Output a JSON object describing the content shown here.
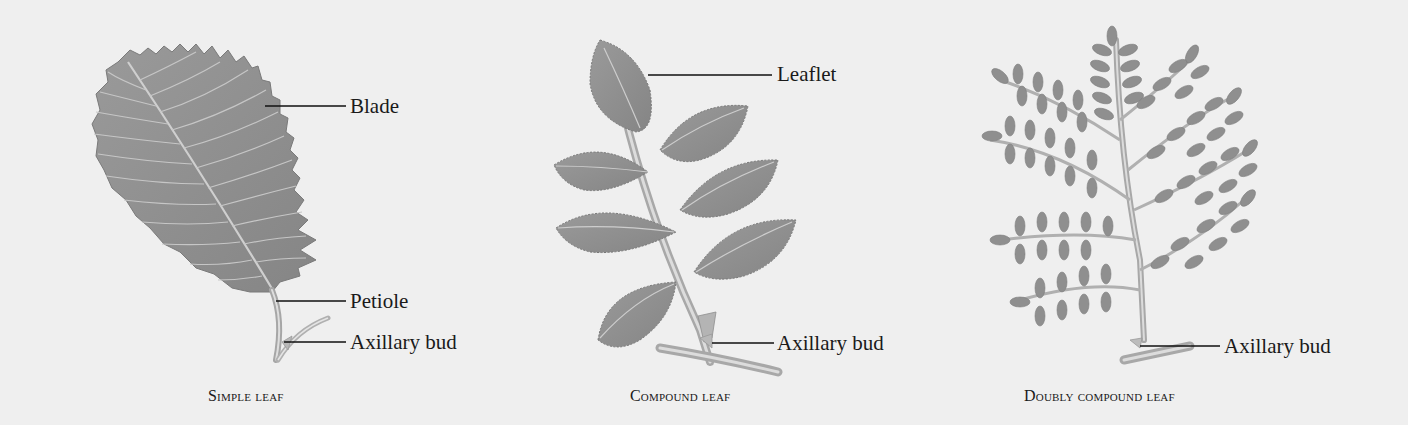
{
  "figure": {
    "background": "#efefef",
    "leaf_color": "#8e8e8e",
    "vein_color": "#c9c9c9",
    "leader_color": "#111111"
  },
  "panels": [
    {
      "id": "simple",
      "caption": "Simple leaf",
      "labels": [
        {
          "text": "Blade"
        },
        {
          "text": "Petiole"
        },
        {
          "text": "Axillary bud"
        }
      ]
    },
    {
      "id": "compound",
      "caption": "Compound leaf",
      "labels": [
        {
          "text": "Leaflet"
        },
        {
          "text": "Axillary bud"
        }
      ]
    },
    {
      "id": "doubly",
      "caption": "Doubly compound leaf",
      "labels": [
        {
          "text": "Axillary bud"
        }
      ]
    }
  ]
}
